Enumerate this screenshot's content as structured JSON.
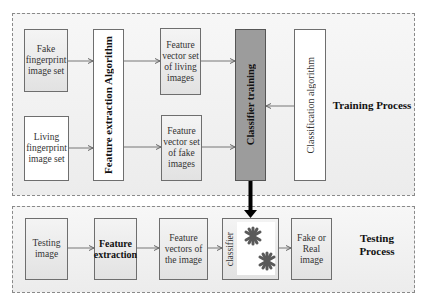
{
  "training": {
    "label": "Training Process",
    "fake_set": "Fake fingerprint image set",
    "living_set": "Living fingerprint image set",
    "feature_extraction": "Feature extraction  Algorithm",
    "fv_living": "Feature vector set of living images",
    "fv_fake": "Feature vector set of fake images",
    "classifier_training": "Classifier training",
    "classification_algorithm": "Classification algorithm"
  },
  "testing": {
    "label": "Testing Process",
    "testing_image": "Testing image",
    "feature_extraction": "Feature extraction",
    "feature_vectors": "Feature vectors of the image",
    "classifier": "classifier",
    "result": "Fake or Real image"
  },
  "colors": {
    "region_bg": "#efefef",
    "border": "#6e6e6e",
    "classifier_training_fill": "#9c9c9c",
    "star": "#5a5a5a",
    "main_arrow": "#000000"
  }
}
